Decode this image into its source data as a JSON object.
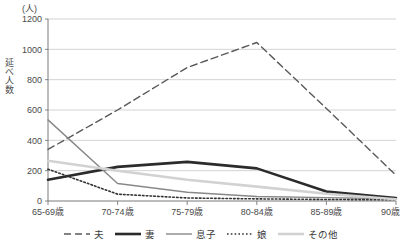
{
  "chart_data": {
    "type": "line",
    "title": "",
    "unit_label": "(人)",
    "ylabel": "延べ人数",
    "xlabel": "",
    "categories": [
      "65-69歳",
      "70-74歳",
      "75-79歳",
      "80-84歳",
      "85-89歳",
      "90歳"
    ],
    "ylim": [
      0,
      1200
    ],
    "yticks": [
      0,
      200,
      400,
      600,
      800,
      1000,
      1200
    ],
    "ytick_labels": [
      "0",
      "200",
      "400",
      "600",
      "800",
      "1000",
      "1200"
    ],
    "grid": true,
    "legend_position": "bottom",
    "series": [
      {
        "name": "夫",
        "style": "dashed",
        "color": "#595959",
        "width": 1.4,
        "values": [
          340,
          600,
          880,
          1045,
          610,
          170
        ]
      },
      {
        "name": "妻",
        "style": "solid",
        "color": "#2b2b2b",
        "width": 2.6,
        "values": [
          140,
          225,
          258,
          215,
          62,
          20
        ]
      },
      {
        "name": "息子",
        "style": "solid",
        "color": "#888888",
        "width": 1.4,
        "values": [
          535,
          115,
          58,
          30,
          22,
          15
        ]
      },
      {
        "name": "娘",
        "style": "dotted",
        "color": "#333333",
        "width": 1.6,
        "values": [
          210,
          45,
          20,
          14,
          10,
          8
        ]
      },
      {
        "name": "その他",
        "style": "solid",
        "color": "#d2d2d2",
        "width": 2.6,
        "values": [
          265,
          200,
          140,
          95,
          48,
          12
        ]
      }
    ]
  },
  "axes": {
    "grid_color": "#c8c8c8",
    "axis_color": "#6b6b6b"
  },
  "legend": {
    "items": [
      {
        "label": "夫",
        "icon": "dashed-line-swatch"
      },
      {
        "label": "妻",
        "icon": "thick-solid-line-swatch"
      },
      {
        "label": "息子",
        "icon": "solid-line-swatch"
      },
      {
        "label": "娘",
        "icon": "dotted-line-swatch"
      },
      {
        "label": "その他",
        "icon": "light-solid-line-swatch"
      }
    ]
  }
}
